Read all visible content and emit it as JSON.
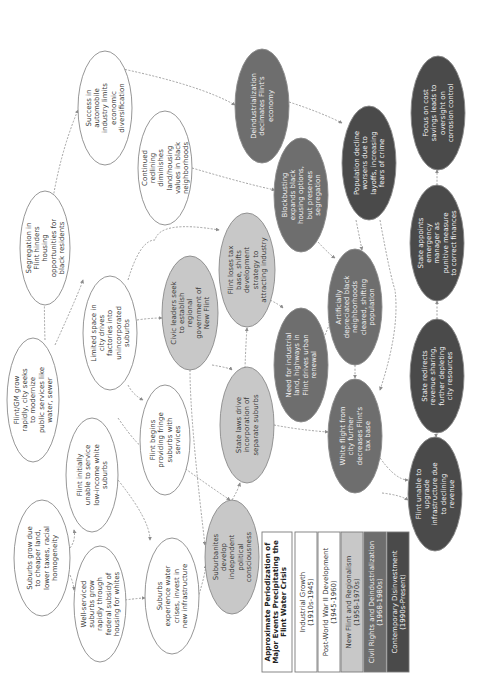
{
  "colors": {
    "industrial": "#ffffff",
    "postwar": "#ffffff",
    "newflint": "#c8c8c8",
    "civilrights": "#6e6e6e",
    "contemporary": "#4a4a4a",
    "stroke": "#8a8a8a",
    "edge": "#8c8c8c",
    "text_dark": "#3a3a3a",
    "text_light": "#f2f2f2"
  },
  "legend": {
    "title_lines": [
      "Approximate Periodization of",
      "Major Events Precipitating the",
      "Flint Water Crisis"
    ],
    "periods": [
      {
        "id": "industrial",
        "lines": [
          "Industrial Growth",
          "(1910s-1945)"
        ]
      },
      {
        "id": "postwar",
        "lines": [
          "Post-World War II Development",
          "(1945-1960)"
        ]
      },
      {
        "id": "newflint",
        "lines": [
          "New Flint and Regionalism",
          "(1958-1970s)"
        ]
      },
      {
        "id": "civilrights",
        "lines": [
          "Civil Rights and Deindustrialization",
          "(1968-1980s)"
        ]
      },
      {
        "id": "contemporary",
        "lines": [
          "Contemporary Disinvestment",
          "(1990s-Present)"
        ]
      }
    ]
  },
  "nodes": [
    {
      "id": "suburbs_grow",
      "period": "industrial",
      "cx": 42,
      "cy": 558,
      "rx": 28,
      "ry": 58,
      "lines": [
        "Suburbs grow due",
        "to cheaper land,",
        "lower taxes, racial",
        "homogeneity"
      ]
    },
    {
      "id": "flint_gm_grow",
      "period": "industrial",
      "cx": 33,
      "cy": 400,
      "rx": 26,
      "ry": 62,
      "lines": [
        "Flint/GM grow",
        "rapidly, city seeks",
        "to modernize",
        "public services like",
        "water, sewer"
      ]
    },
    {
      "id": "segregation",
      "period": "industrial",
      "cx": 45,
      "cy": 248,
      "rx": 25,
      "ry": 57,
      "lines": [
        "Segregation in",
        "Flint hinders",
        "housing",
        "opportunities for",
        "black residents"
      ]
    },
    {
      "id": "success_auto",
      "period": "industrial",
      "cx": 105,
      "cy": 108,
      "rx": 27,
      "ry": 57,
      "lines": [
        "Success in",
        "automobile",
        "industry limits",
        "economic",
        "diversification"
      ]
    },
    {
      "id": "well_serviced",
      "period": "postwar",
      "cx": 100,
      "cy": 604,
      "rx": 26,
      "ry": 58,
      "lines": [
        "Well-serviced",
        "suburbs grow",
        "rapidly through",
        "federal subsidy of",
        "housing for whites"
      ]
    },
    {
      "id": "flint_unable_service",
      "period": "postwar",
      "cx": 92,
      "cy": 475,
      "rx": 26,
      "ry": 57,
      "lines": [
        "Flint initially",
        "unable to service",
        "low-income white",
        "suburbs"
      ]
    },
    {
      "id": "limited_space",
      "period": "postwar",
      "cx": 110,
      "cy": 333,
      "rx": 27,
      "ry": 57,
      "lines": [
        "Limited space in",
        "city drives",
        "factories into",
        "unincorporated",
        "suburbs"
      ]
    },
    {
      "id": "continued_redlining",
      "period": "postwar",
      "cx": 165,
      "cy": 168,
      "rx": 27,
      "ry": 57,
      "lines": [
        "Continued",
        "redlining",
        "diminishes",
        "land/housing",
        "values in black",
        "neighborhoods"
      ]
    },
    {
      "id": "suburbs_water",
      "period": "postwar",
      "cx": 172,
      "cy": 596,
      "rx": 27,
      "ry": 58,
      "lines": [
        "Suburbs",
        "experience water",
        "crises, invest in",
        "new infrastructure"
      ]
    },
    {
      "id": "flint_fringe",
      "period": "postwar",
      "cx": 165,
      "cy": 440,
      "rx": 25,
      "ry": 55,
      "lines": [
        "Flint begins",
        "providing fringe",
        "suburbs with",
        "services"
      ]
    },
    {
      "id": "civic_leaders",
      "period": "newflint",
      "cx": 190,
      "cy": 313,
      "rx": 28,
      "ry": 57,
      "lines": [
        "Civic leaders seek",
        "to establish",
        "regional",
        "government of",
        "New Flint"
      ]
    },
    {
      "id": "suburbanites",
      "period": "newflint",
      "cx": 232,
      "cy": 557,
      "rx": 27,
      "ry": 57,
      "lines": [
        "Suburbanites",
        "develop",
        "independent",
        "political",
        "consciousness"
      ]
    },
    {
      "id": "state_laws",
      "period": "newflint",
      "cx": 247,
      "cy": 425,
      "rx": 27,
      "ry": 58,
      "lines": [
        "State laws drive",
        "incorporation of",
        "separate suburbs"
      ]
    },
    {
      "id": "flint_loses_tax",
      "period": "newflint",
      "cx": 247,
      "cy": 270,
      "rx": 28,
      "ry": 57,
      "lines": [
        "Flint loses tax",
        "base, shifts",
        "development",
        "strategy to",
        "attracting industry"
      ]
    },
    {
      "id": "deindustrialization",
      "period": "civilrights",
      "cx": 262,
      "cy": 106,
      "rx": 27,
      "ry": 57,
      "lines": [
        "Deindustrialization",
        "decimates Flint's",
        "economy"
      ]
    },
    {
      "id": "blockbusting",
      "period": "civilrights",
      "cx": 301,
      "cy": 195,
      "rx": 27,
      "ry": 57,
      "lines": [
        "Blockbusting",
        "expands black",
        "housing options,",
        "but preserves",
        "segregation"
      ]
    },
    {
      "id": "need_industrial",
      "period": "civilrights",
      "cx": 301,
      "cy": 365,
      "rx": 27,
      "ry": 57,
      "lines": [
        "Need for industrial",
        "land, highways in",
        "Flint drives urban",
        "renewal"
      ]
    },
    {
      "id": "artificially_depreciated",
      "period": "civilrights",
      "cx": 355,
      "cy": 307,
      "rx": 27,
      "ry": 58,
      "lines": [
        "Artificially",
        "depreciated black",
        "neighborhoods",
        "cleared, shifting",
        "population"
      ]
    },
    {
      "id": "white_flight",
      "period": "civilrights",
      "cx": 355,
      "cy": 436,
      "rx": 27,
      "ry": 57,
      "lines": [
        "White flight from",
        "city further",
        "decreases Flint's",
        "tax base"
      ]
    },
    {
      "id": "population_decline",
      "period": "contemporary",
      "cx": 369,
      "cy": 163,
      "rx": 27,
      "ry": 57,
      "lines": [
        "Population decline",
        "worsens due to",
        "layoffs, increasing",
        "fears of crime"
      ]
    },
    {
      "id": "focus_cost",
      "period": "contemporary",
      "cx": 438,
      "cy": 113,
      "rx": 27,
      "ry": 57,
      "lines": [
        "Focus on cost",
        "savings leads to",
        "oversight on",
        "corrosion control"
      ]
    },
    {
      "id": "state_appoints",
      "period": "contemporary",
      "cx": 437,
      "cy": 243,
      "rx": 27,
      "ry": 58,
      "lines": [
        "State appoints",
        "emergency",
        "manager as",
        "punitive measure",
        "to correct finances"
      ]
    },
    {
      "id": "state_redirects",
      "period": "contemporary",
      "cx": 437,
      "cy": 376,
      "rx": 27,
      "ry": 57,
      "lines": [
        "State redirects",
        "revenue sharing,",
        "further depleting",
        "city resources"
      ]
    },
    {
      "id": "flint_unable_upgrade",
      "period": "contemporary",
      "cx": 435,
      "cy": 494,
      "rx": 27,
      "ry": 57,
      "lines": [
        "Flint unable to",
        "upgrade",
        "infrastructure due",
        "to declining",
        "revenue"
      ]
    }
  ],
  "edges": [
    {
      "d": "M70,548 Q76,540 74,530"
    },
    {
      "d": "M70,575 Q74,585 74,590"
    },
    {
      "d": "M55,345 Q80,290 83,280"
    },
    {
      "d": "M45,340 Q40,200 78,110"
    },
    {
      "d": "M118,418 Q140,450 150,452"
    },
    {
      "d": "M125,600 Q140,598 145,598"
    },
    {
      "d": "M118,480 Q150,520 150,540"
    },
    {
      "d": "M198,598 Q205,575 206,565"
    },
    {
      "d": "M137,320 Q150,318 162,318"
    },
    {
      "d": "M128,385 Q133,395 143,400"
    },
    {
      "d": "M128,280 Q140,240 155,240 Q160,220 219,230"
    },
    {
      "d": "M212,365 Q230,368 232,370"
    },
    {
      "d": "M190,370 Q190,420 205,545"
    },
    {
      "d": "M232,500 Q238,490 240,483"
    },
    {
      "d": "M245,368 Q246,340 247,328"
    },
    {
      "d": "M270,300 Q280,305 283,308"
    },
    {
      "d": "M274,425 Q300,430 328,432"
    },
    {
      "d": "M118,68 Q200,85 235,105"
    },
    {
      "d": "M192,168 Q250,185 275,190"
    },
    {
      "d": "M160,450 Q200,480 230,500"
    },
    {
      "d": "M289,102 Q320,112 342,123"
    },
    {
      "d": "M318,242 Q330,255 335,258"
    },
    {
      "d": "M325,335 Q328,328 331,320"
    },
    {
      "d": "M355,365 Q355,372 355,378"
    },
    {
      "d": "M380,220 Q390,275 395,290 Q400,330 380,390"
    },
    {
      "d": "M356,220 Q360,240 362,250"
    },
    {
      "d": "M378,455 Q395,480 408,480"
    },
    {
      "d": "M382,493 Q400,495 408,500"
    },
    {
      "d": "M437,436 Q436,436 436,437"
    },
    {
      "d": "M437,319 Q437,310 437,301"
    },
    {
      "d": "M437,185 Q437,178 437,170"
    },
    {
      "d": "M436,434 Q437,440 437,437"
    }
  ]
}
